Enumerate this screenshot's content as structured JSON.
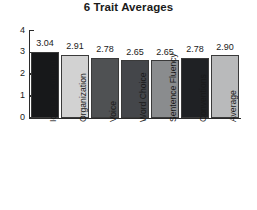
{
  "chart_data": {
    "type": "bar",
    "title": "6 Trait Averages",
    "xlabel": "",
    "ylabel": "",
    "ylim": [
      0,
      4
    ],
    "yticks": [
      "0",
      "1",
      "2",
      "3",
      "4"
    ],
    "grid": false,
    "legend": false,
    "categories": [
      "Ideas & Content",
      "Organization",
      "Voice",
      "Word Choice",
      "Sentence Fluency",
      "Conventions",
      "Average"
    ],
    "values": [
      3.04,
      2.91,
      2.78,
      2.65,
      2.65,
      2.78,
      2.9
    ],
    "value_labels": [
      "3.04",
      "2.91",
      "2.78",
      "2.65",
      "2.65",
      "2.78",
      "2.90"
    ],
    "bar_colors": [
      "#17181a",
      "#d2d2d2",
      "#4f5153",
      "#44464a",
      "#8a8c8e",
      "#1f2124",
      "#b9babb"
    ],
    "bar_edge_color": "#3a3a3a"
  }
}
